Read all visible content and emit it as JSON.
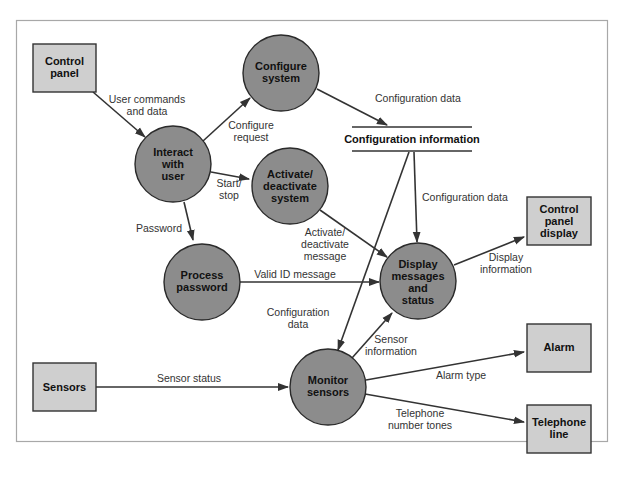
{
  "diagram": {
    "type": "data-flow-diagram",
    "colors": {
      "external": "#cfcfcf",
      "process": "#8c8c8c",
      "line": "#333333",
      "frame": "#a8a8a8"
    },
    "externals": [
      {
        "id": "control_panel",
        "lines": [
          "Control",
          "panel"
        ]
      },
      {
        "id": "sensors",
        "lines": [
          "Sensors"
        ]
      },
      {
        "id": "control_panel_display",
        "lines": [
          "Control",
          "panel",
          "display"
        ]
      },
      {
        "id": "alarm",
        "lines": [
          "Alarm"
        ]
      },
      {
        "id": "telephone_line",
        "lines": [
          "Telephone",
          "line"
        ]
      }
    ],
    "processes": [
      {
        "id": "configure_system",
        "lines": [
          "Configure",
          "system"
        ]
      },
      {
        "id": "interact_with_user",
        "lines": [
          "Interact",
          "with",
          "user"
        ]
      },
      {
        "id": "activate_deactivate",
        "lines": [
          "Activate/",
          "deactivate",
          "system"
        ]
      },
      {
        "id": "process_password",
        "lines": [
          "Process",
          "password"
        ]
      },
      {
        "id": "display_messages",
        "lines": [
          "Display",
          "messages",
          "and",
          "status"
        ]
      },
      {
        "id": "monitor_sensors",
        "lines": [
          "Monitor",
          "sensors"
        ]
      }
    ],
    "store": {
      "id": "configuration_information",
      "label": "Configuration information"
    },
    "flows": [
      {
        "from": "control_panel",
        "to": "interact_with_user",
        "lines": [
          "User commands",
          "and data"
        ]
      },
      {
        "from": "interact_with_user",
        "to": "configure_system",
        "lines": [
          "Configure",
          "request"
        ]
      },
      {
        "from": "interact_with_user",
        "to": "activate_deactivate",
        "lines": [
          "Start/",
          "stop"
        ]
      },
      {
        "from": "interact_with_user",
        "to": "process_password",
        "lines": [
          "Password"
        ]
      },
      {
        "from": "configure_system",
        "to": "configuration_information",
        "lines": [
          "Configuration data"
        ]
      },
      {
        "from": "configuration_information",
        "to": "display_messages",
        "lines": [
          "Configuration data"
        ]
      },
      {
        "from": "configuration_information",
        "to": "monitor_sensors",
        "lines": [
          "Configuration",
          "data"
        ]
      },
      {
        "from": "activate_deactivate",
        "to": "display_messages",
        "lines": [
          "Activate/",
          "deactivate",
          "message"
        ]
      },
      {
        "from": "process_password",
        "to": "display_messages",
        "lines": [
          "Valid ID message"
        ]
      },
      {
        "from": "display_messages",
        "to": "control_panel_display",
        "lines": [
          "Display",
          "information"
        ]
      },
      {
        "from": "monitor_sensors",
        "to": "display_messages",
        "lines": [
          "Sensor",
          "information"
        ]
      },
      {
        "from": "sensors",
        "to": "monitor_sensors",
        "lines": [
          "Sensor status"
        ]
      },
      {
        "from": "monitor_sensors",
        "to": "alarm",
        "lines": [
          "Alarm type"
        ]
      },
      {
        "from": "monitor_sensors",
        "to": "telephone_line",
        "lines": [
          "Telephone",
          "number tones"
        ]
      }
    ]
  }
}
